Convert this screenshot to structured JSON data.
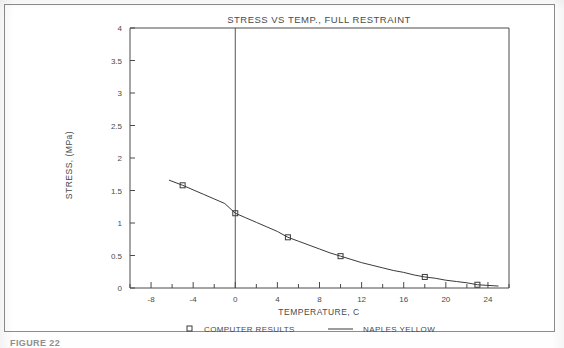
{
  "figure": {
    "caption_fragment": "FIGURE 22",
    "background_color": "#ffffff",
    "frame_color": "#8c8c8c",
    "ink_color": "#4a4a4a"
  },
  "chart_data": {
    "type": "line",
    "title": "STRESS VS TEMP., FULL RESTRAINT",
    "xlabel": "TEMPERATURE, C",
    "ylabel": "STRESS, (MPa)",
    "xlim": [
      -10,
      26
    ],
    "ylim": [
      0,
      4
    ],
    "xticks": [
      -8,
      -4,
      0,
      4,
      8,
      12,
      16,
      20,
      24
    ],
    "xticklabels": [
      "-8",
      "-4",
      "0",
      "4",
      "8",
      "12",
      "16",
      "20",
      "24"
    ],
    "xminor_step": 2,
    "yticks": [
      0,
      0.5,
      1,
      1.5,
      2,
      2.5,
      3,
      3.5,
      4
    ],
    "yticklabels": [
      "0",
      "0.5",
      "1",
      "1.5",
      "2",
      "2.5",
      "3",
      "3.5",
      "4"
    ],
    "grid": false,
    "legend_position": "below",
    "reference_lines": [
      {
        "name": "zero-temperature-line",
        "axis": "x",
        "value": 0
      }
    ],
    "series": [
      {
        "name": "COMPUTER RESULTS",
        "style": "markers",
        "marker": "open-square",
        "color": "#3a3a3a",
        "x": [
          -5,
          0,
          5,
          10,
          18,
          23
        ],
        "y": [
          1.58,
          1.15,
          0.78,
          0.49,
          0.17,
          0.05
        ]
      },
      {
        "name": "NAPLES YELLOW",
        "style": "line",
        "color": "#3a3a3a",
        "x": [
          -6.3,
          -5,
          -4,
          -3,
          -2,
          -1,
          0,
          1,
          2,
          3,
          4,
          5,
          6,
          7,
          8,
          9,
          10,
          11,
          12,
          13,
          14,
          15,
          16,
          17,
          18,
          19,
          20,
          21,
          22,
          23,
          24,
          25
        ],
        "y": [
          1.66,
          1.58,
          1.51,
          1.44,
          1.37,
          1.3,
          1.15,
          1.08,
          1.01,
          0.94,
          0.87,
          0.78,
          0.72,
          0.66,
          0.6,
          0.54,
          0.49,
          0.44,
          0.39,
          0.35,
          0.31,
          0.27,
          0.24,
          0.2,
          0.17,
          0.15,
          0.12,
          0.1,
          0.08,
          0.05,
          0.04,
          0.03
        ]
      }
    ],
    "legend": [
      {
        "label": "COMPUTER RESULTS",
        "symbol": "open-square"
      },
      {
        "label": "NAPLES YELLOW",
        "symbol": "line"
      }
    ]
  }
}
